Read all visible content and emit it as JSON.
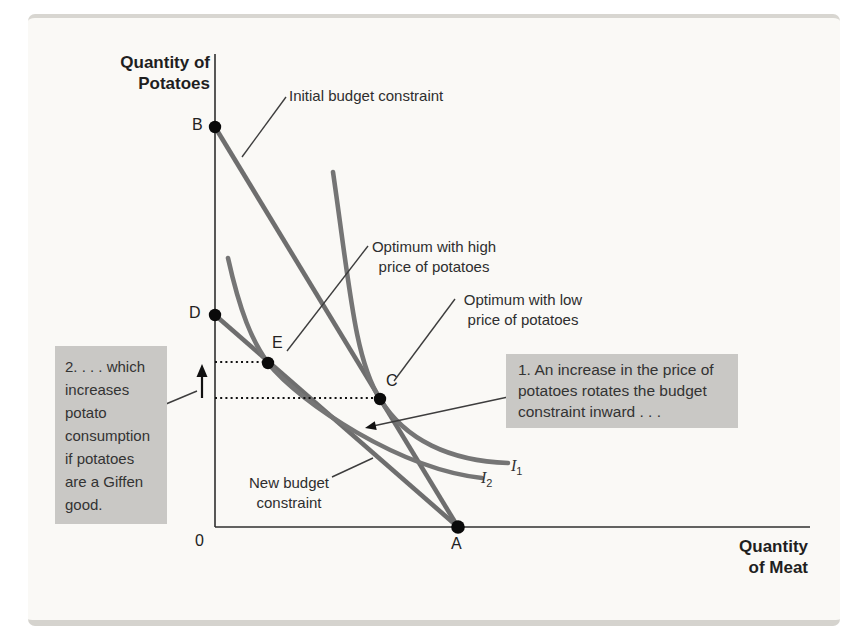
{
  "figure": {
    "y_axis_title": "Quantity of\nPotatoes",
    "x_axis_title": "Quantity\nof Meat",
    "origin_label": "0",
    "points": {
      "B": "B",
      "D": "D",
      "E": "E",
      "C": "C",
      "A": "A"
    },
    "labels": {
      "initial_budget": "Initial budget constraint",
      "optimum_high": "Optimum with high\nprice of potatoes",
      "optimum_low": "Optimum with low\nprice of potatoes",
      "new_budget": "New budget\nconstraint"
    },
    "curves": {
      "i1": {
        "letter": "I",
        "sub": "1"
      },
      "i2": {
        "letter": "I",
        "sub": "2"
      }
    },
    "callouts": {
      "box1": "1. An increase in the price of\npotatoes rotates the budget\nconstraint inward . . .",
      "box2": "2. . . . which\nincreases\npotato\nconsumption\nif potatoes\nare a Giffen\ngood."
    },
    "colors": {
      "line_gray": "#6e6e6e",
      "box_gray": "#c9c8c5",
      "axis_black": "#2f2f2f",
      "panel_bg": "#faf9f6"
    }
  }
}
